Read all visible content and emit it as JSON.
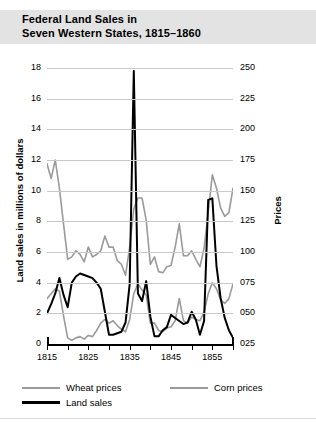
{
  "title": "Federal Land Sales in\nSeven Western States, 1815–1860",
  "axes": {
    "y_left_title": "Land sales in millions of dollars",
    "y_right_title": "Prices",
    "y_left_ticks": [
      "0",
      "2",
      "4",
      "6",
      "8",
      "10",
      "12",
      "14",
      "16",
      "18"
    ],
    "y_right_ticks": [
      "025",
      "050",
      "075",
      "100",
      "125",
      "150",
      "175",
      "200",
      "225",
      "250"
    ],
    "x_ticks": [
      "1815",
      "1825",
      "1835",
      "1845",
      "1855"
    ]
  },
  "legend": {
    "wheat": "Wheat prices",
    "corn": "Corn prices",
    "land": "Land sales"
  },
  "colors": {
    "land_sales": "#000000",
    "wheat_prices": "#9a9a9a",
    "corn_prices": "#9a9a9a",
    "gridline": "#c9c9c9",
    "banner": "#e3e3e3",
    "background": "#ffffff"
  },
  "chart_data": {
    "type": "line",
    "title": "Federal Land Sales in Seven Western States, 1815–1860",
    "xlabel": "",
    "ylabel": "Land sales in millions of dollars",
    "y2label": "Prices",
    "xlim": [
      1815,
      1860
    ],
    "ylim": [
      0,
      18
    ],
    "y2lim": [
      25,
      250
    ],
    "grid": true,
    "legend_position": "below-plot-left",
    "x": [
      1815,
      1816,
      1817,
      1818,
      1819,
      1820,
      1821,
      1822,
      1823,
      1824,
      1825,
      1826,
      1827,
      1828,
      1829,
      1830,
      1831,
      1832,
      1833,
      1834,
      1835,
      1836,
      1837,
      1838,
      1839,
      1840,
      1841,
      1842,
      1843,
      1844,
      1845,
      1846,
      1847,
      1848,
      1849,
      1850,
      1851,
      1852,
      1853,
      1854,
      1855,
      1856,
      1857,
      1858,
      1859,
      1860
    ],
    "series": [
      {
        "name": "Land sales",
        "axis": "left",
        "units": "millions of dollars",
        "color": "#000000",
        "values": [
          2.0,
          2.6,
          3.3,
          4.3,
          3.2,
          2.4,
          4.0,
          4.4,
          4.6,
          4.5,
          4.4,
          4.3,
          4.0,
          3.6,
          2.1,
          0.6,
          0.6,
          0.7,
          0.8,
          1.4,
          3.9,
          17.8,
          3.3,
          2.8,
          4.1,
          1.8,
          0.5,
          0.5,
          0.9,
          1.1,
          1.9,
          1.7,
          1.5,
          1.3,
          1.4,
          2.1,
          1.6,
          0.6,
          1.5,
          9.4,
          9.5,
          5.1,
          3.0,
          1.7,
          0.9,
          0.4
        ]
      },
      {
        "name": "Wheat prices",
        "axis": "right",
        "units": "index",
        "color": "#9a9a9a",
        "values": [
          172,
          160,
          175,
          152,
          123,
          94,
          96,
          101,
          98,
          92,
          104,
          96,
          98,
          101,
          113,
          104,
          104,
          93,
          90,
          81,
          104,
          135,
          144,
          144,
          126,
          90,
          96,
          84,
          83,
          88,
          89,
          104,
          123,
          97,
          97,
          101,
          94,
          88,
          103,
          132,
          163,
          152,
          136,
          129,
          132,
          152
        ]
      },
      {
        "name": "Corn prices",
        "axis": "right",
        "units": "index",
        "color": "#9a9a9a",
        "values": [
          62,
          66,
          70,
          68,
          48,
          30,
          28,
          30,
          31,
          29,
          32,
          31,
          36,
          42,
          45,
          42,
          44,
          40,
          37,
          35,
          45,
          66,
          74,
          69,
          65,
          42,
          42,
          36,
          35,
          38,
          39,
          44,
          62,
          44,
          42,
          47,
          45,
          44,
          51,
          66,
          75,
          70,
          61,
          58,
          62,
          74
        ]
      }
    ]
  }
}
